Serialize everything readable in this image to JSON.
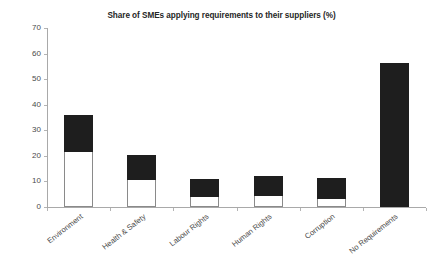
{
  "chart": {
    "title": "Share of SMEs applying requirements to their suppliers (%)",
    "xlabel": "",
    "ylabel": ""
  },
  "chart_data": {
    "type": "bar",
    "title": "Share of SMEs applying requirements to their suppliers (%)",
    "xlabel": "",
    "ylabel": "",
    "ylim": [
      0,
      70
    ],
    "yticks": [
      0,
      10,
      20,
      30,
      40,
      50,
      60,
      70
    ],
    "ytick_labels": [
      "0",
      "10",
      "20",
      "30",
      "40",
      "50",
      "60",
      "70"
    ],
    "grid": false,
    "legend": "none",
    "stacked": true,
    "categories": [
      "Environment",
      "Health & Safety",
      "Labour Rights",
      "Human Rights",
      "Corruption",
      "No Requirements"
    ],
    "series": [
      {
        "name": "lower-segment",
        "fill": "#ffffff",
        "values": [
          21.5,
          10.5,
          3.9,
          4.3,
          3.0,
          0
        ]
      },
      {
        "name": "upper-segment",
        "fill": "#1e1e1e",
        "values": [
          14.5,
          10.0,
          6.9,
          7.9,
          8.3,
          56.5
        ]
      }
    ],
    "totals": [
      36.0,
      20.5,
      10.8,
      12.2,
      11.3,
      56.5
    ]
  },
  "colors": {
    "bar_dark": "#1e1e1e",
    "bar_light": "#ffffff",
    "axis": "#a9a9a9",
    "text": "#4a4a4a",
    "title": "#262626",
    "background": "#ffffff"
  }
}
